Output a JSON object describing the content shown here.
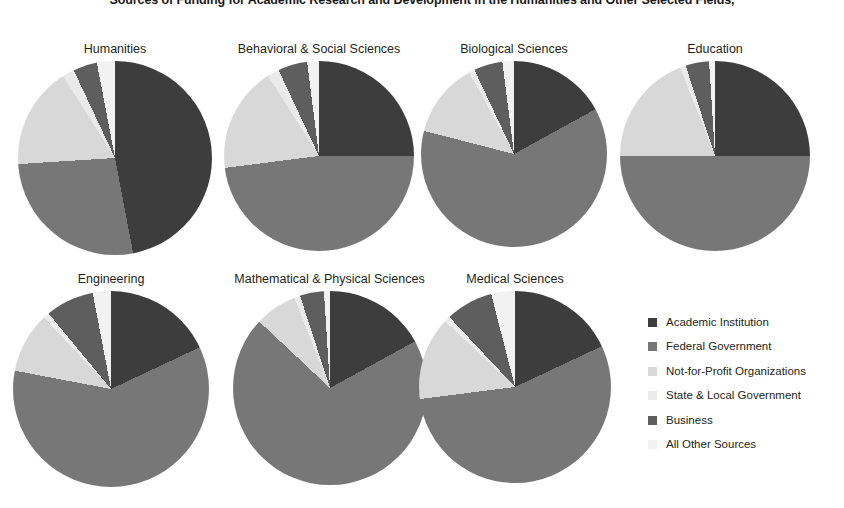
{
  "chart_data": {
    "type": "pie",
    "title": "Sources of Funding for Academic Research and Development in the Humanities and Other Selected Fields,",
    "subtitle": "",
    "xlabel": "",
    "ylabel": "",
    "legend_position": "right",
    "grid": false,
    "categories": [
      "Academic Institution",
      "Federal Government",
      "Not-for-Profit Organizations",
      "State & Local Government",
      "Business",
      "All Other Sources"
    ],
    "colors": [
      "#3d3d3d",
      "#777777",
      "#d8d8d8",
      "#eaeaea",
      "#5e5e5e",
      "#f2f2f2"
    ],
    "panels": [
      {
        "name": "humanities",
        "title": "Humanities",
        "values": [
          47,
          27,
          17,
          2,
          4,
          3
        ]
      },
      {
        "name": "behavioral-social-sciences",
        "title": "Behavioral & Social Sciences",
        "values": [
          25,
          48,
          18,
          2,
          5,
          2
        ]
      },
      {
        "name": "biological-sciences",
        "title": "Biological Sciences",
        "values": [
          17,
          62,
          13,
          1,
          5,
          2
        ]
      },
      {
        "name": "education",
        "title": "Education",
        "values": [
          25,
          50,
          19,
          1,
          4,
          1
        ]
      },
      {
        "name": "engineering",
        "title": "Engineering",
        "values": [
          18,
          60,
          10,
          1,
          8,
          3
        ]
      },
      {
        "name": "mathematical-physical-sciences",
        "title": "Mathematical & Physical Sciences",
        "values": [
          17,
          70,
          7,
          1,
          4,
          1
        ]
      },
      {
        "name": "medical-sciences",
        "title": "Medical Sciences",
        "values": [
          18,
          55,
          14,
          1,
          8,
          4
        ]
      }
    ]
  },
  "legend": {
    "items": [
      {
        "label": "Academic Institution",
        "color": "#3d3d3d"
      },
      {
        "label": "Federal Government",
        "color": "#777777"
      },
      {
        "label": "Not-for-Profit Organizations",
        "color": "#d8d8d8"
      },
      {
        "label": "State & Local Government",
        "color": "#eaeaea"
      },
      {
        "label": "Business",
        "color": "#5e5e5e"
      },
      {
        "label": "All Other Sources",
        "color": "#f2f2f2"
      }
    ]
  },
  "layout": {
    "panel_geometry": [
      {
        "left": 20,
        "top": 42,
        "width": 190,
        "diameter": 194
      },
      {
        "left": 224,
        "top": 42,
        "width": 190,
        "diameter": 190
      },
      {
        "left": 419,
        "top": 42,
        "width": 190,
        "diameter": 186
      },
      {
        "left": 620,
        "top": 42,
        "width": 190,
        "diameter": 190
      },
      {
        "left": 16,
        "top": 272,
        "width": 190,
        "diameter": 196
      },
      {
        "left": 222,
        "top": 272,
        "width": 215,
        "diameter": 194
      },
      {
        "left": 420,
        "top": 272,
        "width": 190,
        "diameter": 192
      }
    ]
  }
}
